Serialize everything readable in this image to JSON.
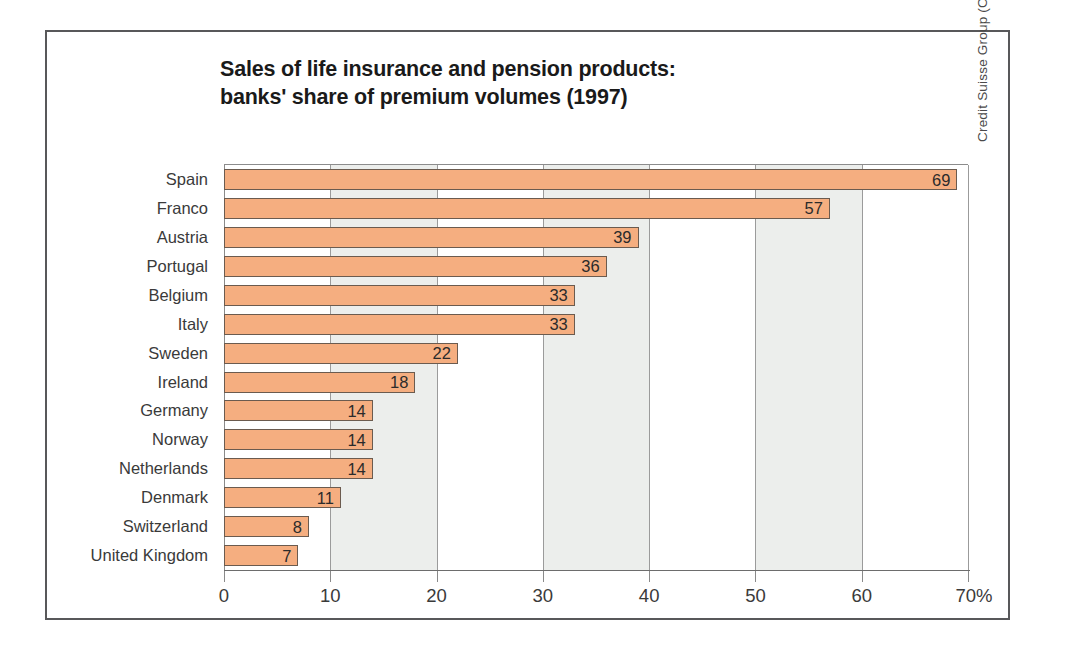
{
  "chart_data": {
    "type": "bar",
    "orientation": "horizontal",
    "title": "Sales of life insurance and pension products: banks' share of premium volumes (1997)",
    "title_lines": [
      "Sales of life insurance and pension products:",
      "banks' share of premium volumes (1997)"
    ],
    "categories": [
      "Spain",
      "Franco",
      "Austria",
      "Portugal",
      "Belgium",
      "Italy",
      "Sweden",
      "Ireland",
      "Germany",
      "Norway",
      "Netherlands",
      "Denmark",
      "Switzerland",
      "United Kingdom"
    ],
    "values": [
      69,
      57,
      39,
      36,
      33,
      33,
      22,
      18,
      14,
      14,
      14,
      11,
      8,
      7
    ],
    "value_labels": [
      "69",
      "57",
      "39",
      "36",
      "33",
      "33",
      "22",
      "18",
      "14",
      "14",
      "14",
      "11",
      "8",
      "7"
    ],
    "xlabel": "",
    "ylabel": "",
    "xlim": [
      0,
      70
    ],
    "xticks": [
      0,
      10,
      20,
      30,
      40,
      50,
      60,
      70
    ],
    "xtick_labels": [
      "0",
      "10",
      "20",
      "30",
      "40",
      "50",
      "60",
      "70%"
    ],
    "unit": "%",
    "grid": "vertical gridlines at every 10 units with alternating shaded vertical bands",
    "shaded_bands": [
      [
        10,
        20
      ],
      [
        30,
        40
      ],
      [
        50,
        60
      ]
    ],
    "legend": "none",
    "bar_color": "#f5ae80",
    "bar_border_color": "#6b5b4f",
    "band_color": "#e9ebe9",
    "gridline_color": "#9b9b9b",
    "frame_color": "#58585a",
    "text_color": "#3a3a3a"
  },
  "credit": {
    "text": "Credit Suisse Group (Corporate History and Archives) 2000"
  }
}
